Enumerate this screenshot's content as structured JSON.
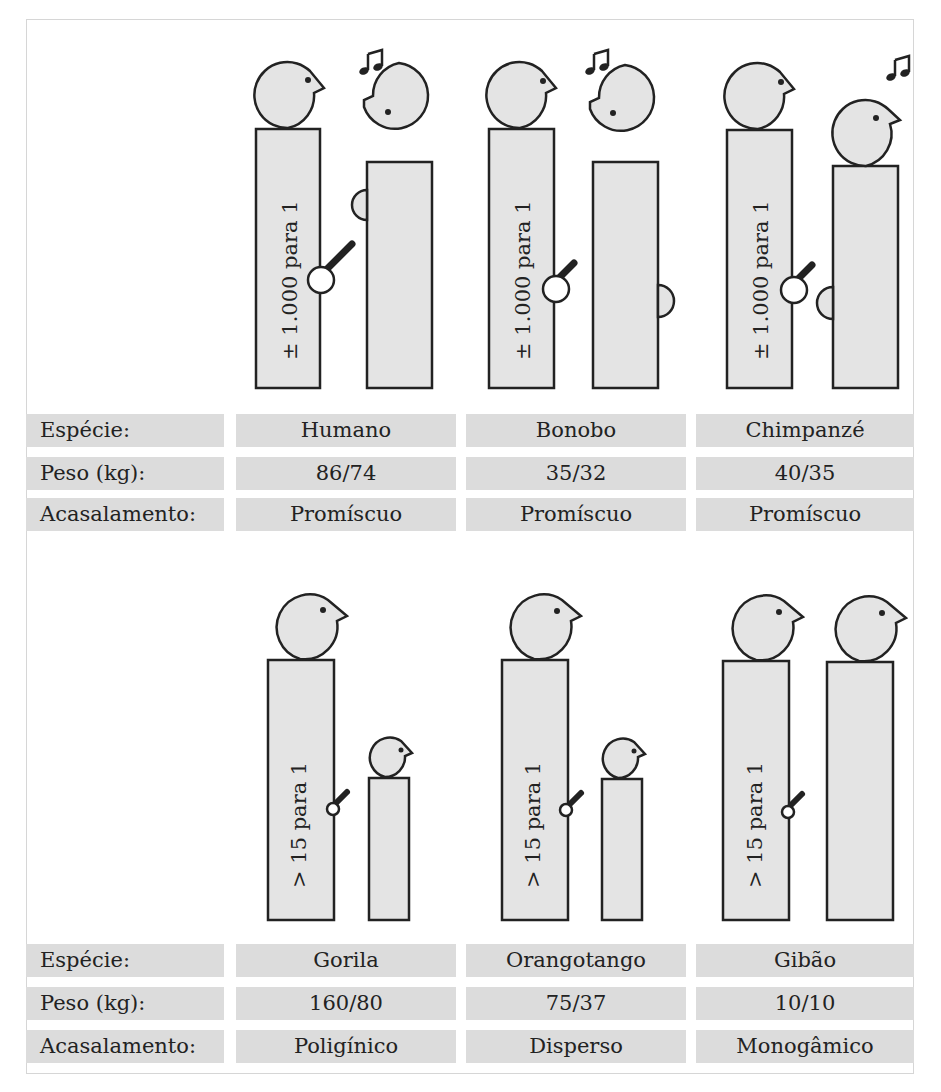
{
  "groups": [
    {
      "ratio_label": "± 1.000 para 1",
      "species": [
        {
          "name": "Humano",
          "weight": "86/74",
          "mating": "Promíscuo"
        },
        {
          "name": "Bonobo",
          "weight": "35/32",
          "mating": "Promíscuo"
        },
        {
          "name": "Chimpanzé",
          "weight": "40/35",
          "mating": "Promíscuo"
        }
      ]
    },
    {
      "ratio_label": "> 15 para 1",
      "species": [
        {
          "name": "Gorila",
          "weight": "160/80",
          "mating": "Poligínico"
        },
        {
          "name": "Orangotango",
          "weight": "75/37",
          "mating": "Disperso"
        },
        {
          "name": "Gibão",
          "weight": "10/10",
          "mating": "Monogâmico"
        }
      ]
    }
  ],
  "row_labels": {
    "species": "Espécie:",
    "weight": "Peso (kg):",
    "mating": "Acasalamento:"
  },
  "colors": {
    "figure_fill": "#e4e4e4",
    "stroke": "#222222",
    "cell_bg": "#dcdcdc"
  }
}
